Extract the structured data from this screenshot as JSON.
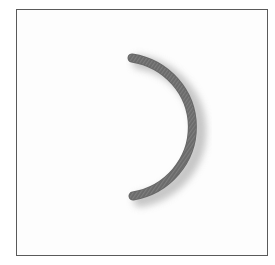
{
  "image": {
    "subject": "C-shaped coiled ring",
    "frame_color": "#5a5a5a",
    "background_color": "#fdfdfd",
    "object_color": "#6b6b6b",
    "object_highlight_color": "#8a8a8a",
    "shadow_color": "#b8b8b8"
  }
}
